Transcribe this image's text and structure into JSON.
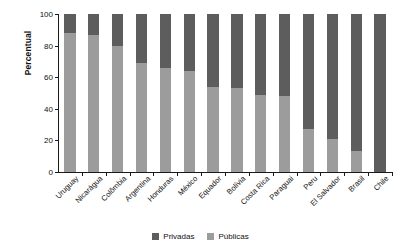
{
  "chart_data": {
    "type": "bar",
    "subtype": "stacked-percentage-column",
    "title": "",
    "xlabel": "",
    "ylabel": "Percentual",
    "ylim": [
      0,
      100
    ],
    "yticks": [
      0,
      20,
      40,
      60,
      80,
      100
    ],
    "ytick_labels": [
      "0",
      "20",
      "40",
      "60",
      "80",
      "100"
    ],
    "grid": false,
    "legend_position": "bottom-center",
    "categories": [
      "Uruguay",
      "Nicarágua",
      "Colômbia",
      "Argentina",
      "Honduras",
      "México",
      "Equador",
      "Bolívia",
      "Costa Rica",
      "Paraguai",
      "Peru",
      "El Salvador",
      "Brasil",
      "Chile"
    ],
    "series": [
      {
        "name": "Privadas",
        "color": "#5d5d5d",
        "values": [
          12,
          13,
          20,
          31,
          34,
          36,
          46,
          47,
          51,
          52,
          73,
          79,
          87,
          100
        ]
      },
      {
        "name": "Públicas",
        "color": "#9c9c9c",
        "values": [
          88,
          87,
          80,
          69,
          66,
          64,
          54,
          53,
          49,
          48,
          27,
          21,
          13,
          0
        ]
      }
    ]
  },
  "legend": {
    "items": [
      {
        "label": "Privadas",
        "color": "#5d5d5d"
      },
      {
        "label": "Públicas",
        "color": "#9c9c9c"
      }
    ]
  },
  "axis": {
    "y_title": "Percentual"
  }
}
